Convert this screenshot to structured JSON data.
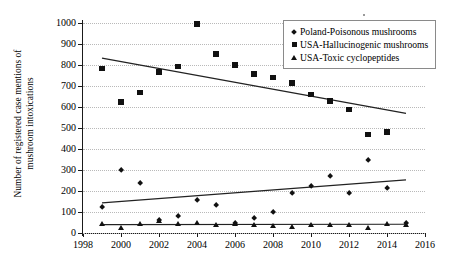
{
  "chart_data": {
    "type": "scatter",
    "title": "",
    "xlabel": "",
    "ylabel": "Number of registered case mentions of\nmushroom intoxications",
    "xlim": [
      1998,
      2016
    ],
    "ylim": [
      0,
      1000
    ],
    "xticks": [
      1998,
      2000,
      2002,
      2004,
      2006,
      2008,
      2010,
      2012,
      2014,
      2016
    ],
    "yticks": [
      0,
      100,
      200,
      300,
      400,
      500,
      600,
      700,
      800,
      900,
      1000
    ],
    "grid": true,
    "legend_position": "top-right",
    "x": [
      1999,
      2000,
      2001,
      2002,
      2003,
      2004,
      2005,
      2006,
      2007,
      2008,
      2009,
      2010,
      2011,
      2012,
      2013,
      2014,
      2015
    ],
    "series": [
      {
        "name": "Poland-Poisonous mushrooms",
        "marker": "diamond",
        "x": [
          1999,
          2000,
          2001,
          2002,
          2003,
          2004,
          2005,
          2006,
          2007,
          2008,
          2009,
          2010,
          2011,
          2012,
          2013,
          2014,
          2015
        ],
        "values": [
          125,
          300,
          238,
          62,
          78,
          158,
          133,
          45,
          70,
          98,
          188,
          225,
          272,
          190,
          345,
          215,
          45
        ],
        "trendline": {
          "x": [
            1999,
            2015
          ],
          "y": [
            143,
            253
          ]
        }
      },
      {
        "name": "USA-Hallucinogenic mushrooms",
        "marker": "square",
        "x": [
          1999,
          2000,
          2001,
          2002,
          2003,
          2004,
          2005,
          2006,
          2007,
          2008,
          2009,
          2010,
          2011,
          2012,
          2013,
          2014
        ],
        "values": [
          783,
          625,
          670,
          768,
          793,
          995,
          852,
          800,
          757,
          740,
          715,
          660,
          628,
          588,
          470,
          480
        ],
        "trendline": {
          "x": [
            1999,
            2015
          ],
          "y": [
            833,
            570
          ]
        }
      },
      {
        "name": "USA-Toxic cyclopeptides",
        "marker": "triangle",
        "x": [
          1999,
          2000,
          2001,
          2002,
          2003,
          2004,
          2005,
          2006,
          2007,
          2008,
          2009,
          2010,
          2011,
          2012,
          2013,
          2014,
          2015
        ],
        "values": [
          42,
          25,
          45,
          58,
          42,
          48,
          40,
          42,
          38,
          35,
          28,
          40,
          38,
          40,
          22,
          42,
          40
        ],
        "trendline": {
          "x": [
            1999,
            2015
          ],
          "y": [
            40,
            42
          ]
        }
      }
    ]
  },
  "legend": {
    "items": [
      {
        "label": "Poland-Poisonous mushrooms",
        "marker": "diamond"
      },
      {
        "label": "USA-Hallucinogenic mushrooms",
        "marker": "square"
      },
      {
        "label": "USA-Toxic cyclopeptides",
        "marker": "triangle"
      }
    ]
  }
}
